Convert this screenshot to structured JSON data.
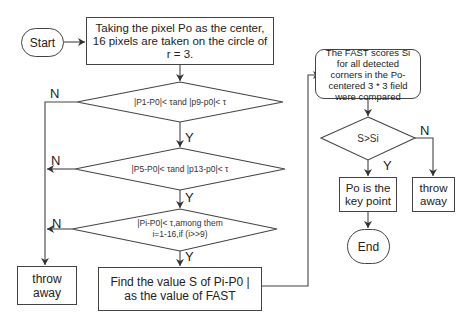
{
  "nodes": {
    "start": "Start",
    "step1": "Taking the pixel Po as the center, 16 pixels are taken on the circle of r = 3.",
    "cond1": "|P1-P0|< τand |p9-p0|< τ",
    "cond2": "|P5-P0|< τand |p13-p0|< τ",
    "cond3_line1": "|Pi-P0|< τ,among them",
    "cond3_line2": "i=1-16,if (i>>9)",
    "throw_left": "throw away",
    "fast_value": "Find the value S of Pi-P0 | as the value of FAST",
    "compare": "The FAST scores Si for all detected corners in the Po-centered 3 * 3 field were compared",
    "cond4": "S>Si",
    "keypoint": "Po is the key point",
    "throw_right": "throw away",
    "end": "End"
  },
  "edge_labels": {
    "n1": "N",
    "n2": "N",
    "n3": "N",
    "y1": "Y",
    "y2": "Y",
    "y3": "Y",
    "n4": "N",
    "y4": "Y"
  }
}
